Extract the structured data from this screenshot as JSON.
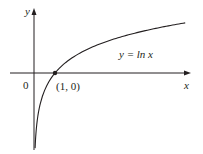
{
  "chart_data": {
    "type": "line",
    "title": "",
    "xlabel": "x",
    "ylabel": "y",
    "origin_label": "0",
    "grid": false,
    "legend": null,
    "function": "ln x",
    "annotations": [
      {
        "text": "y = ln x",
        "kind": "curve-label"
      },
      {
        "text": "(1, 0)",
        "kind": "point-label",
        "x": 1,
        "y": 0
      }
    ],
    "series": [
      {
        "name": "y = ln x",
        "x": [
          0.05,
          0.1,
          0.2,
          0.3,
          0.5,
          0.75,
          1,
          1.5,
          2,
          3,
          4,
          5,
          6,
          7.2
        ],
        "y": [
          -3.0,
          -2.3,
          -1.61,
          -1.2,
          -0.69,
          -0.29,
          0,
          0.41,
          0.69,
          1.1,
          1.39,
          1.61,
          1.79,
          1.97
        ]
      }
    ],
    "points": [
      {
        "x": 1,
        "y": 0,
        "label": "(1, 0)",
        "marker": "filled-dot"
      }
    ],
    "xlim": [
      -1.1,
      7.5
    ],
    "ylim": [
      -3.0,
      2.5
    ],
    "colors": {
      "curve": "#231f20",
      "axes": "#231f20",
      "background": "#ffffff"
    }
  }
}
